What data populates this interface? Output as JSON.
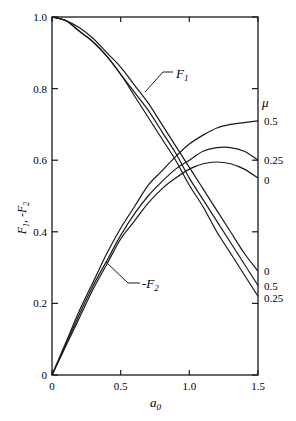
{
  "chart_data": {
    "type": "line",
    "title": "",
    "xlabel": "a_0",
    "ylabel": "F_1, -F_2",
    "xlim": [
      0,
      1.5
    ],
    "ylim": [
      0,
      1.0
    ],
    "x_ticks": [
      "0",
      "0.5",
      "1.0",
      "1.5"
    ],
    "y_ticks": [
      "0",
      "0.2",
      "0.4",
      "0.6",
      "0.8",
      "1.0"
    ],
    "grid": false,
    "legend_title": "μ",
    "x": [
      0,
      0.1,
      0.2,
      0.3,
      0.4,
      0.5,
      0.6,
      0.7,
      0.8,
      0.9,
      1.0,
      1.1,
      1.2,
      1.3,
      1.4,
      1.5
    ],
    "series": [
      {
        "name": "F1 (μ=0)",
        "group": "F1",
        "mu": "0",
        "values": [
          1.0,
          0.99,
          0.97,
          0.94,
          0.9,
          0.86,
          0.81,
          0.76,
          0.7,
          0.64,
          0.58,
          0.52,
          0.46,
          0.4,
          0.34,
          0.29
        ]
      },
      {
        "name": "F1 (μ=0.5)",
        "group": "F1",
        "mu": "0.5",
        "values": [
          1.0,
          0.99,
          0.96,
          0.93,
          0.89,
          0.84,
          0.79,
          0.74,
          0.68,
          0.62,
          0.55,
          0.49,
          0.43,
          0.37,
          0.31,
          0.25
        ]
      },
      {
        "name": "F1 (μ=0.25)",
        "group": "F1",
        "mu": "0.25",
        "values": [
          1.0,
          0.99,
          0.96,
          0.93,
          0.89,
          0.84,
          0.78,
          0.72,
          0.66,
          0.6,
          0.53,
          0.47,
          0.4,
          0.34,
          0.28,
          0.22
        ]
      },
      {
        "name": "-F2 (μ=0.5)",
        "group": "-F2",
        "mu": "0.5",
        "values": [
          0.0,
          0.09,
          0.18,
          0.26,
          0.34,
          0.41,
          0.47,
          0.53,
          0.57,
          0.61,
          0.645,
          0.67,
          0.69,
          0.7,
          0.705,
          0.71
        ]
      },
      {
        "name": "-F2 (μ=0.25)",
        "group": "-F2",
        "mu": "0.25",
        "values": [
          0.0,
          0.085,
          0.17,
          0.25,
          0.32,
          0.39,
          0.45,
          0.5,
          0.54,
          0.575,
          0.6,
          0.625,
          0.635,
          0.635,
          0.625,
          0.6
        ]
      },
      {
        "name": "-F2 (μ=0)",
        "group": "-F2",
        "mu": "0",
        "values": [
          0.0,
          0.08,
          0.16,
          0.24,
          0.31,
          0.38,
          0.43,
          0.48,
          0.52,
          0.55,
          0.575,
          0.59,
          0.595,
          0.59,
          0.575,
          0.55
        ]
      }
    ],
    "annotations": [
      {
        "text": "F_1",
        "at": [
          0.65,
          0.76
        ]
      },
      {
        "text": "-F_2",
        "at": [
          0.45,
          0.3
        ]
      },
      {
        "text": "μ",
        "position": "right",
        "value": null
      }
    ],
    "right_labels": {
      "F2": [
        "0.5",
        "0.25",
        "0"
      ],
      "F1": [
        "0",
        "0.5",
        "0.25"
      ]
    }
  },
  "labels": {
    "y_axis": "F",
    "y_axis_sub1": "1",
    "y_axis_sep": ", -F",
    "y_axis_sub2": "2",
    "x_axis": "a",
    "x_axis_sub": "0",
    "f1": "F",
    "f1_sub": "1",
    "f2": "-F",
    "f2_sub": "2",
    "mu": "μ"
  }
}
